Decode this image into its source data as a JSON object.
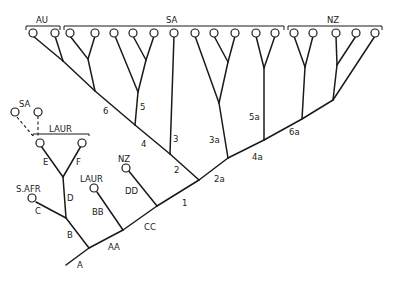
{
  "diagram": {
    "type": "phylogenetic-cladogram",
    "groups": {
      "au": "AU",
      "sa": "SA",
      "nz": "NZ",
      "laur_box": "LAUR",
      "sa_dashed": "SA"
    },
    "tip_labels": {
      "s_afr": "S.AFR",
      "laur": "LAUR",
      "nz": "NZ"
    },
    "branch_labels": {
      "A": "A",
      "B": "B",
      "C": "C",
      "D": "D",
      "E": "E",
      "F": "F",
      "AA": "AA",
      "BB": "BB",
      "CC": "CC",
      "DD": "DD",
      "n1": "1",
      "n2": "2",
      "n3": "3",
      "n4": "4",
      "n5": "5",
      "n6": "6",
      "n2a": "2a",
      "n3a": "3a",
      "n4a": "4a",
      "n5a": "5a",
      "n6a": "6a"
    },
    "colors": {
      "line": "#1a1a1a",
      "background": "#ffffff"
    }
  }
}
